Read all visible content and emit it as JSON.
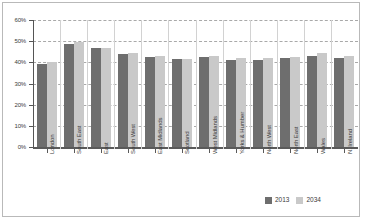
{
  "chart_data": {
    "type": "bar",
    "title": "",
    "xlabel": "",
    "ylabel": "",
    "ylim": [
      0,
      60
    ],
    "ytick_labels": [
      "60%",
      "50%",
      "40%",
      "30%",
      "20%",
      "10%",
      "0%"
    ],
    "ytick_values": [
      60,
      50,
      40,
      30,
      20,
      10,
      0
    ],
    "grid": true,
    "legend_position": "bottom-right",
    "categories": [
      "London",
      "South East",
      "East",
      "South West",
      "East Midlands",
      "Scotland",
      "West Midlands",
      "Yorks & Humber",
      "North West",
      "North East",
      "Wales",
      "N. Ireland"
    ],
    "series": [
      {
        "name": "2013",
        "color": "#6e6e6e",
        "values": [
          39,
          48.5,
          47,
          44,
          42.5,
          41.5,
          42.5,
          41,
          41,
          42,
          43,
          42
        ]
      },
      {
        "name": "2034",
        "color": "#c9c9c9",
        "values": [
          40,
          49.5,
          47,
          44.5,
          43,
          41.5,
          43,
          42,
          42,
          42.5,
          44.5,
          43
        ]
      }
    ]
  },
  "legend": {
    "items": [
      {
        "label": "2013",
        "color": "#6e6e6e"
      },
      {
        "label": "2034",
        "color": "#c9c9c9"
      }
    ]
  }
}
